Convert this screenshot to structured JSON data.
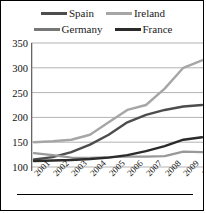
{
  "chart_data": {
    "type": "line",
    "title": "",
    "xlabel": "",
    "ylabel": "",
    "x": [
      "2001",
      "2002",
      "2003",
      "2004",
      "2005",
      "2006",
      "2007",
      "2008",
      "2009",
      "2010"
    ],
    "ylim": [
      100,
      350
    ],
    "yticks": [
      100,
      150,
      200,
      250,
      300,
      350
    ],
    "grid": true,
    "legend_position": "top",
    "series": [
      {
        "name": "Spain",
        "color": "#4d4d4d",
        "values": [
          115,
          120,
          130,
          145,
          165,
          190,
          205,
          215,
          222,
          225
        ]
      },
      {
        "name": "Ireland",
        "color": "#a6a6a6",
        "values": [
          150,
          152,
          155,
          165,
          190,
          215,
          225,
          258,
          300,
          315
        ]
      },
      {
        "name": "Germany",
        "color": "#999999",
        "values": [
          128,
          124,
          119,
          118,
          120,
          121,
          121,
          122,
          131,
          130
        ]
      },
      {
        "name": "France",
        "color": "#2b2b2b",
        "values": [
          112,
          113,
          114,
          116,
          119,
          124,
          132,
          142,
          155,
          160
        ]
      }
    ]
  },
  "legend": {
    "rows": [
      [
        {
          "label": "Spain",
          "swatch": "legend-swatch-spain",
          "color": "#4d4d4d"
        },
        {
          "label": "Ireland",
          "swatch": "legend-swatch-ireland",
          "color": "#a6a6a6"
        }
      ],
      [
        {
          "label": "Germany",
          "swatch": "legend-swatch-germany",
          "color": "#777777"
        },
        {
          "label": "France",
          "swatch": "legend-swatch-france",
          "color": "#2b2b2b"
        }
      ]
    ]
  },
  "axes": {
    "y_tick_labels": [
      "350",
      "300",
      "250",
      "200",
      "150",
      "100"
    ],
    "x_tick_labels": [
      "2001",
      "2002",
      "2003",
      "2004",
      "2005",
      "2006",
      "2007",
      "2008",
      "2009",
      "2010"
    ]
  }
}
